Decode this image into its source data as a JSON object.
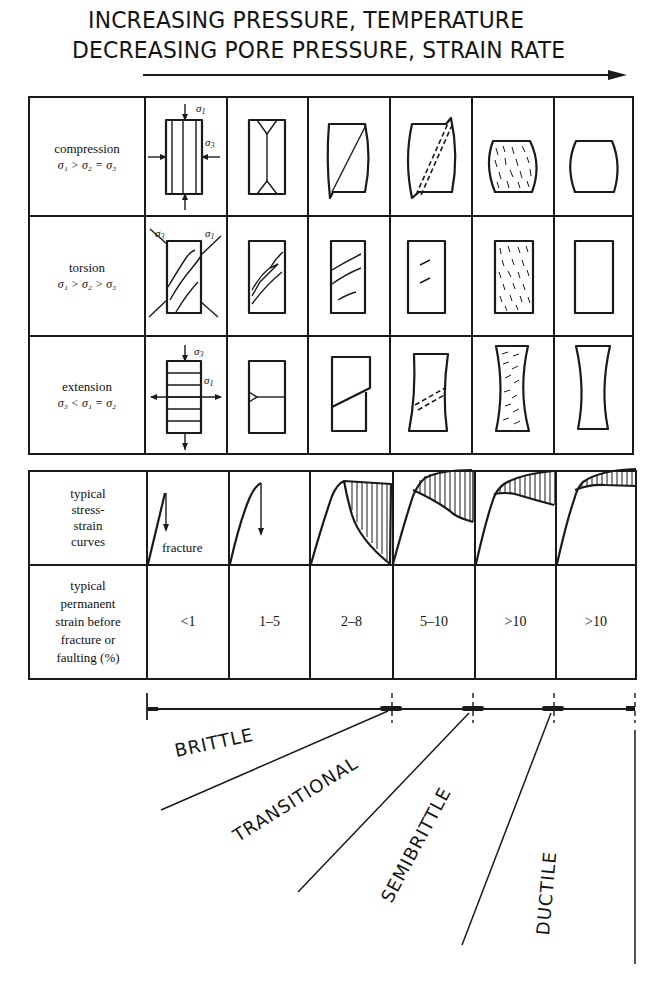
{
  "header": {
    "line1": "INCREASING PRESSURE, TEMPERATURE",
    "line2": "DECREASING PORE PRESSURE, STRAIN RATE",
    "arrow_direction": "right"
  },
  "table_deformation": {
    "rows": [
      {
        "label": "compression",
        "condition": "σ₁ > σ₂ = σ₃"
      },
      {
        "label": "torsion",
        "condition": "σ₁ > σ₂ > σ₃"
      },
      {
        "label": "extension",
        "condition": "σ₃ < σ₁ = σ₂"
      }
    ],
    "stress_labels": {
      "s1": "σ",
      "s1_sub": "1",
      "s3": "σ",
      "s3_sub": "3"
    },
    "columns": 6
  },
  "table_strain": {
    "curves_label": [
      "typical",
      "stress-",
      "strain",
      "curves"
    ],
    "fracture_label": "fracture",
    "strain_label": [
      "typical",
      "permanent",
      "strain before",
      "fracture or",
      "faulting (%)"
    ],
    "strain_values": [
      "<1",
      "1–5",
      "2–8",
      "5–10",
      ">10",
      ">10"
    ]
  },
  "regimes": [
    {
      "label": "BRITTLE"
    },
    {
      "label": "TRANSITIONAL"
    },
    {
      "label": "SEMIBRITTLE"
    },
    {
      "label": "DUCTILE"
    }
  ]
}
